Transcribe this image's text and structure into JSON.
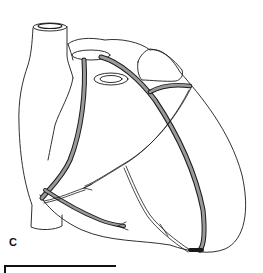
{
  "figure": {
    "panel_label": "C",
    "colors": {
      "outline": "#1a1a1a",
      "vessel_fill": "#9a9a9a",
      "background": "#ffffff"
    }
  },
  "scale_bar": {
    "label": ""
  }
}
